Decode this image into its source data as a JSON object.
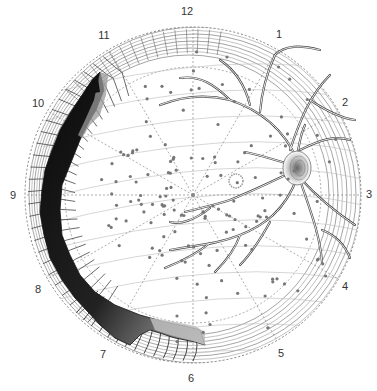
{
  "diagram": {
    "type": "retinal-fundus-drawing",
    "center": [
      193,
      195
    ],
    "outer_radius": 168,
    "clock_labels": [
      {
        "label": "12",
        "x": 187,
        "y": 11
      },
      {
        "label": "1",
        "x": 279,
        "y": 34
      },
      {
        "label": "2",
        "x": 345,
        "y": 102
      },
      {
        "label": "3",
        "x": 369,
        "y": 194
      },
      {
        "label": "4",
        "x": 345,
        "y": 286
      },
      {
        "label": "5",
        "x": 281,
        "y": 353
      },
      {
        "label": "6",
        "x": 191,
        "y": 378
      },
      {
        "label": "7",
        "x": 103,
        "y": 354
      },
      {
        "label": "8",
        "x": 38,
        "y": 289
      },
      {
        "label": "9",
        "x": 13,
        "y": 195
      },
      {
        "label": "10",
        "x": 38,
        "y": 103
      },
      {
        "label": "11",
        "x": 104,
        "y": 35
      }
    ],
    "features": {
      "optic_disc": {
        "x": 295,
        "y": 168,
        "label": "optic-disc"
      },
      "macula": {
        "x": 236,
        "y": 181,
        "label": "macula"
      },
      "detachment_region": "left-inferior (clock hours 6–11)",
      "vessels": "superior and inferior arcades from optic disc"
    },
    "colors": {
      "line": "#555555",
      "dark_detachment": "#111111",
      "grey_gradient": "#888888",
      "dots": "#777777"
    }
  }
}
